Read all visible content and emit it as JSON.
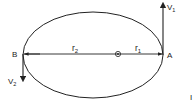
{
  "diagram": {
    "type": "elliptical-orbit",
    "points": {
      "a_label": "A",
      "b_label": "B"
    },
    "radii": {
      "r1_base": "r",
      "r1_sub": "1",
      "r2_base": "r",
      "r2_sub": "2"
    },
    "velocities": {
      "v1_base": "V",
      "v1_sub": "1",
      "v2_base": "V",
      "v2_sub": "2"
    },
    "focus": "focus-dot",
    "edge_mark": "I",
    "colors": {
      "stroke": "#222222",
      "background": "#ffffff"
    }
  }
}
